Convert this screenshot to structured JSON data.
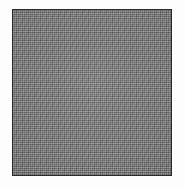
{
  "figure": {
    "kind": "gray-tone-swatch",
    "caption": "",
    "label": "",
    "canvas": {
      "width_px": 185,
      "height_px": 188,
      "background_color": "#fdfdfd"
    },
    "swatch": {
      "left_px": 12,
      "top_px": 9,
      "width_px": 160,
      "height_px": 167,
      "fill_color": "#828282",
      "border_color": "#2a2a2a",
      "border_width_px": 1.5,
      "texture": "halftone-dither"
    }
  }
}
